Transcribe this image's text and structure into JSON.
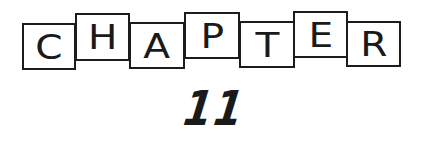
{
  "heading": {
    "word": "CHAPTER",
    "letters": [
      "C",
      "H",
      "A",
      "P",
      "T",
      "E",
      "R"
    ],
    "number": "11"
  },
  "colors": {
    "ink": "#1a1a1a",
    "background": "#ffffff"
  }
}
